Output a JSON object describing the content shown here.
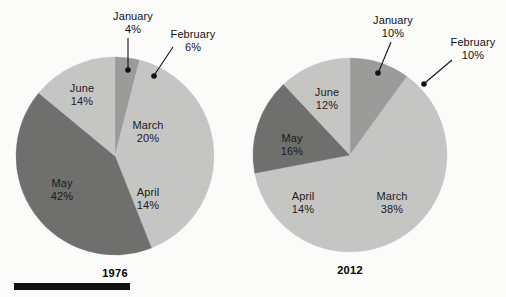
{
  "figure": {
    "background_color": "#fbfbfa",
    "rule_bar": {
      "x": 14,
      "y": 283,
      "width": 116,
      "height": 7,
      "color": "#111111"
    }
  },
  "palette": {
    "light_gray": "#c5c5c4",
    "medium_gray": "#9b9b9a",
    "dark_gray": "#6f6f6e",
    "text": "#111111",
    "leader_line": "#111111"
  },
  "chart_data": {
    "type": "pie",
    "title": "",
    "subtitle": "",
    "xlabel": "",
    "ylabel": "",
    "legend_position": "none",
    "grid": false,
    "start_angle_deg": 0,
    "direction": "clockwise",
    "charts": [
      {
        "title": "1976",
        "center": {
          "x": 115,
          "y": 156
        },
        "radius": 99,
        "categories": [
          "January",
          "February",
          "March",
          "April",
          "May",
          "June"
        ],
        "values": [
          4,
          6,
          20,
          14,
          42,
          14
        ],
        "value_labels": [
          "4%",
          "6%",
          "20%",
          "14%",
          "42%",
          "14%"
        ],
        "colors": [
          "#9b9b9a",
          "#c5c5c4",
          "#c5c5c4",
          "#c5c5c4",
          "#6f6f6e",
          "#c5c5c4"
        ],
        "slice_labels": [
          {
            "name": "March",
            "value": "20%",
            "x": 148,
            "y": 119,
            "callout": false
          },
          {
            "name": "April",
            "value": "14%",
            "x": 148,
            "y": 186,
            "callout": false
          },
          {
            "name": "May",
            "value": "42%",
            "x": 62,
            "y": 177,
            "callout": false
          },
          {
            "name": "June",
            "value": "14%",
            "x": 82,
            "y": 82,
            "callout": false
          }
        ],
        "callouts": [
          {
            "name": "January",
            "value": "4%",
            "label_x": 133,
            "label_y": 10,
            "line": {
              "x1": 128,
              "y1": 38,
              "x2": 128,
              "y2": 69
            },
            "dot": {
              "x": 128,
              "y": 70,
              "r": 2.8
            }
          },
          {
            "name": "February",
            "value": "6%",
            "label_x": 193,
            "label_y": 28,
            "line": {
              "x1": 173,
              "y1": 47,
              "x2": 155,
              "y2": 74
            },
            "dot": {
              "x": 154,
              "y": 76,
              "r": 2.8
            }
          }
        ]
      },
      {
        "title": "2012",
        "center": {
          "x": 350,
          "y": 155
        },
        "radius": 97,
        "categories": [
          "January",
          "February",
          "March",
          "April",
          "May",
          "June"
        ],
        "values": [
          10,
          10,
          38,
          14,
          16,
          12
        ],
        "value_labels": [
          "10%",
          "10%",
          "38%",
          "14%",
          "16%",
          "12%"
        ],
        "colors": [
          "#9b9b9a",
          "#c5c5c4",
          "#c5c5c4",
          "#c5c5c4",
          "#6f6f6e",
          "#c5c5c4"
        ],
        "slice_labels": [
          {
            "name": "March",
            "value": "38%",
            "x": 392,
            "y": 190,
            "callout": false
          },
          {
            "name": "April",
            "value": "14%",
            "x": 303,
            "y": 190,
            "callout": false
          },
          {
            "name": "May",
            "value": "16%",
            "x": 292,
            "y": 132,
            "callout": false
          },
          {
            "name": "June",
            "value": "12%",
            "x": 327,
            "y": 86,
            "callout": false
          }
        ],
        "callouts": [
          {
            "name": "January",
            "value": "10%",
            "label_x": 393,
            "label_y": 14,
            "line": {
              "x1": 391,
              "y1": 42,
              "x2": 379,
              "y2": 71
            },
            "dot": {
              "x": 378,
              "y": 73,
              "r": 2.8
            }
          },
          {
            "name": "February",
            "value": "10%",
            "label_x": 473,
            "label_y": 36,
            "line": {
              "x1": 452,
              "y1": 60,
              "x2": 426,
              "y2": 82
            },
            "dot": {
              "x": 424,
              "y": 84,
              "r": 2.8
            }
          }
        ]
      }
    ]
  }
}
